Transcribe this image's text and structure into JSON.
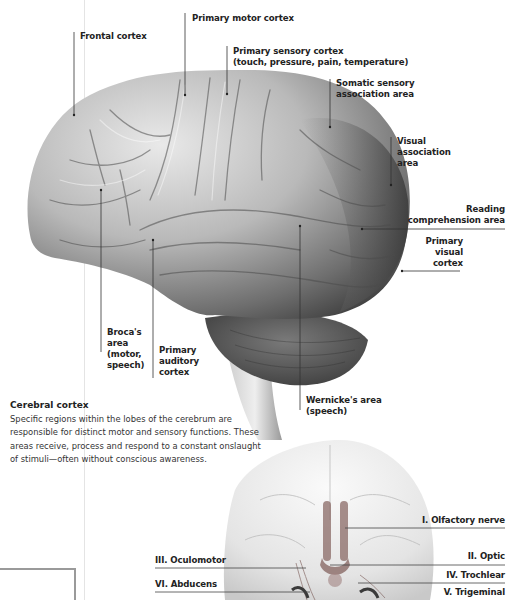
{
  "lateral_view": {
    "labels": [
      {
        "id": "frontal-cortex",
        "text": "Frontal cortex"
      },
      {
        "id": "primary-motor-cortex",
        "text": "Primary motor cortex"
      },
      {
        "id": "primary-sensory-cortex",
        "text": "Primary sensory cortex\n(touch, pressure, pain, temperature)"
      },
      {
        "id": "somatic-sensory-association-area",
        "text": "Somatic sensory\nassociation area"
      },
      {
        "id": "visual-association-area",
        "text": "Visual\nassociation\narea"
      },
      {
        "id": "reading-comprehension-area",
        "text": "Reading\ncomprehension area"
      },
      {
        "id": "primary-visual-cortex",
        "text": "Primary\nvisual\ncortex"
      },
      {
        "id": "brocas-area",
        "text": "Broca's\narea\n(motor,\nspeech)"
      },
      {
        "id": "primary-auditory-cortex",
        "text": "Primary\nauditory\ncortex"
      },
      {
        "id": "wernickes-area",
        "text": "Wernicke's area\n(speech)"
      }
    ]
  },
  "caption": {
    "title": "Cerebral cortex",
    "body": "Specific regions within the lobes of the cerebrum are responsible for distinct motor and sensory functions. These areas receive, process and respond to a constant onslaught of stimuli—often without conscious awareness."
  },
  "ventral_view": {
    "labels": [
      {
        "id": "olfactory-nerve",
        "text": "I. Olfactory nerve"
      },
      {
        "id": "optic",
        "text": "II. Optic"
      },
      {
        "id": "oculomotor",
        "text": "III. Oculomotor"
      },
      {
        "id": "trochlear",
        "text": "IV. Trochlear"
      },
      {
        "id": "abducens",
        "text": "VI. Abducens"
      },
      {
        "id": "trigeminal",
        "text": "V. Trigeminal"
      }
    ]
  },
  "colors": {
    "label_text": "#222222",
    "leader_line": "#333333",
    "brain_light": "#d8d8d8",
    "brain_dark": "#4a4a4a",
    "nerve_accent": "#8a6a66"
  }
}
